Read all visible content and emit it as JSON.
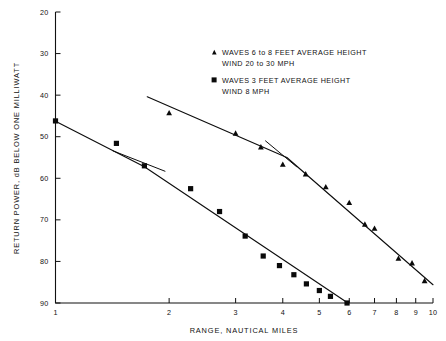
{
  "chart_data": {
    "type": "line",
    "title": "",
    "xlabel": "RANGE, NAUTICAL MILES",
    "ylabel": "RETURN POWER, dB BELOW ONE MILLIWATT",
    "xscale": "log",
    "yscale": "linear",
    "xlim": [
      1,
      10
    ],
    "ylim": [
      90,
      20
    ],
    "y_inverted": true,
    "grid": false,
    "legend_position": "upper right",
    "xticks": [
      1,
      2,
      3,
      4,
      5,
      6,
      7,
      8,
      9,
      10
    ],
    "xtick_labels": [
      "1",
      "2",
      "3",
      "4",
      "5",
      "6",
      "7",
      "8",
      "9",
      "10"
    ],
    "yticks": [
      20,
      30,
      40,
      50,
      60,
      70,
      80,
      90
    ],
    "ytick_labels": [
      "20",
      "30",
      "40",
      "50",
      "60",
      "70",
      "80",
      "90"
    ],
    "series": [
      {
        "name": "WAVES 6 to 8 FEET AVERAGE HEIGHT WIND 20 to 30 MPH",
        "marker": "triangle",
        "points": [
          {
            "x": 2.0,
            "y": 44.2
          },
          {
            "x": 3.0,
            "y": 49.1
          },
          {
            "x": 3.5,
            "y": 52.4
          },
          {
            "x": 4.0,
            "y": 56.6
          },
          {
            "x": 4.6,
            "y": 58.9
          },
          {
            "x": 5.2,
            "y": 62.0
          },
          {
            "x": 6.0,
            "y": 65.8
          },
          {
            "x": 6.6,
            "y": 71.0
          },
          {
            "x": 7.0,
            "y": 72.0
          },
          {
            "x": 8.1,
            "y": 79.2
          },
          {
            "x": 8.8,
            "y": 80.3
          },
          {
            "x": 9.5,
            "y": 84.6
          }
        ],
        "fit_line": [
          {
            "x": 1.75,
            "y": 40.4
          },
          {
            "x": 4.1,
            "y": 55.0
          },
          {
            "x": 10.0,
            "y": 85.6
          }
        ]
      },
      {
        "name": "WAVES 3 FEET AVERAGE HEIGHT WIND 8 MPH",
        "marker": "square",
        "points": [
          {
            "x": 1.0,
            "y": 46.2
          },
          {
            "x": 1.45,
            "y": 51.6
          },
          {
            "x": 1.72,
            "y": 57.0
          },
          {
            "x": 2.28,
            "y": 62.5
          },
          {
            "x": 2.72,
            "y": 68.0
          },
          {
            "x": 3.18,
            "y": 73.9
          },
          {
            "x": 3.55,
            "y": 78.7
          },
          {
            "x": 3.92,
            "y": 81.0
          },
          {
            "x": 4.28,
            "y": 83.2
          },
          {
            "x": 4.62,
            "y": 85.4
          },
          {
            "x": 5.0,
            "y": 87.0
          },
          {
            "x": 5.35,
            "y": 88.4
          },
          {
            "x": 5.92,
            "y": 90.0
          }
        ],
        "fit_line": [
          {
            "x": 1.0,
            "y": 46.3
          },
          {
            "x": 1.72,
            "y": 57.2
          },
          {
            "x": 5.95,
            "y": 90.0
          }
        ]
      }
    ],
    "annotations": [
      {
        "name": "tangent-mark-triangle-series",
        "x1": 3.6,
        "y1": 51.0,
        "x2": 4.35,
        "y2": 57.2
      },
      {
        "name": "tangent-mark-square-series",
        "x1": 1.42,
        "y1": 53.4,
        "x2": 1.95,
        "y2": 58.3
      }
    ]
  },
  "legend": {
    "entries": [
      {
        "marker": "triangle",
        "line1": "WAVES 6 to 8 FEET AVERAGE HEIGHT",
        "line2": "WIND 20 to 30 MPH"
      },
      {
        "marker": "square",
        "line1": "WAVES 3 FEET AVERAGE HEIGHT",
        "line2": "WIND 8 MPH"
      }
    ]
  },
  "colors": {
    "ink": "#0d0d0d",
    "background": "#ffffff"
  }
}
